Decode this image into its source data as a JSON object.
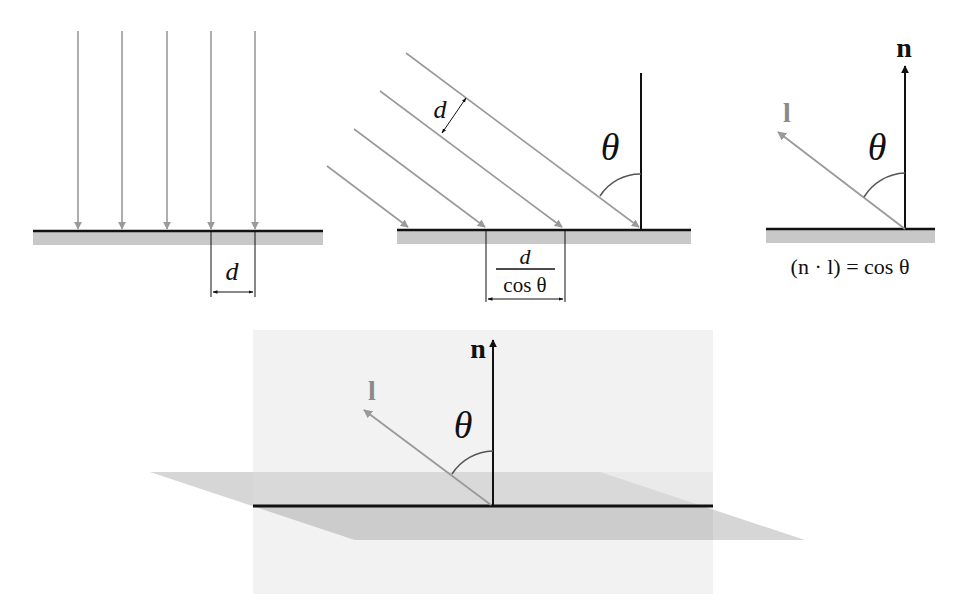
{
  "colors": {
    "ray": "#9a9a9a",
    "surface_line": "#111111",
    "surface_fill": "#c8c8c8",
    "plane_fill": "#d2d2d2",
    "wall_fill": "#f1f1f1",
    "label_dark": "#111111",
    "label_light": "#8a8a8a"
  },
  "panels": [
    {
      "id": "perpendicular-incidence",
      "description": "Parallel light rays hitting a surface head-on",
      "ray_count": 5,
      "labels": {
        "spacing": "d"
      }
    },
    {
      "id": "oblique-incidence",
      "description": "Parallel light rays hitting a surface at angle theta",
      "ray_count": 4,
      "labels": {
        "ray_spacing": "d",
        "angle": "θ",
        "footprint_numerator": "d",
        "footprint_denominator": "cos θ"
      }
    },
    {
      "id": "dot-product",
      "description": "Normal vector n and light vector l with angle theta",
      "labels": {
        "normal": "n",
        "light": "l",
        "angle": "θ",
        "equation": "(n · l) = cos θ"
      }
    },
    {
      "id": "3d-view",
      "description": "Perspective view of the surface plane with normal n and light vector l",
      "labels": {
        "normal": "n",
        "light": "l",
        "angle": "θ"
      }
    }
  ]
}
